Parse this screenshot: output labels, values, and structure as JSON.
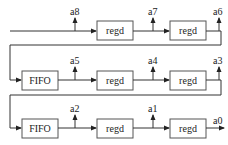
{
  "diagram": {
    "type": "shift-register-chain",
    "rows": [
      {
        "blocks": [
          "regd",
          "regd"
        ],
        "taps": [
          "a8",
          "a7",
          "a6"
        ]
      },
      {
        "blocks": [
          "FIFO",
          "regd",
          "regd"
        ],
        "taps": [
          "a5",
          "a4",
          "a3"
        ]
      },
      {
        "blocks": [
          "FIFO",
          "regd",
          "regd"
        ],
        "taps": [
          "a2",
          "a1",
          "a0"
        ]
      }
    ]
  }
}
